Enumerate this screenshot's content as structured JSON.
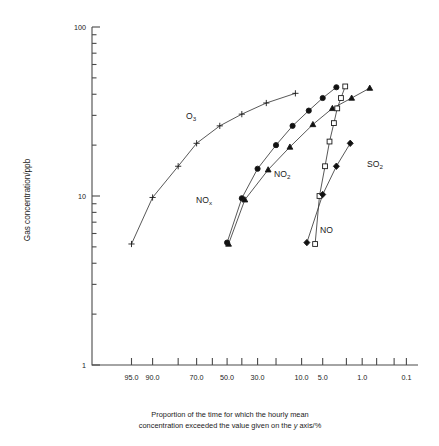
{
  "figure": {
    "ylabel": "Gas concentration/ppb",
    "caption_line1": "Proportion of the time for which the hourly mean",
    "caption_line2a": "concentration exceeded the value given on the ",
    "caption_line2b": "y",
    "caption_line2c": " axis/%"
  },
  "chart_data": {
    "type": "line",
    "title": "",
    "xlabel": "Proportion of the time for which the hourly mean concentration exceeded the value given on the y axis/%",
    "ylabel": "Gas concentration/ppb",
    "x_scale": "probability",
    "y_scale": "log",
    "ylim": [
      1,
      100
    ],
    "xlim": [
      99.0,
      0.05
    ],
    "grid": false,
    "legend": "inline-annotations",
    "y_tick_labels": [
      "100",
      "10",
      "1"
    ],
    "y_major_ticks": [
      100,
      10,
      1
    ],
    "y_minor_ticks": [
      90,
      80,
      70,
      60,
      50,
      40,
      30,
      20,
      9,
      8,
      7,
      6,
      5,
      4,
      3,
      2
    ],
    "x_tick_values": [
      95.0,
      90.0,
      80.0,
      70.0,
      60.0,
      50.0,
      40.0,
      30.0,
      20.0,
      10.0,
      5.0,
      2.0,
      1.0,
      0.5,
      0.2,
      0.1
    ],
    "x_tick_labels": [
      "95.0",
      "90.0",
      "",
      "70.0",
      "",
      "50.0",
      "",
      "30.0",
      "",
      "10.0",
      "5.0",
      "",
      "1.0",
      "",
      "",
      "0.1"
    ],
    "series": [
      {
        "name": "O3",
        "label": "O",
        "label_sub": "3",
        "marker": "plus",
        "filled": false,
        "points": [
          {
            "x": 95.0,
            "y": 5.2
          },
          {
            "x": 90.0,
            "y": 9.8
          },
          {
            "x": 80.0,
            "y": 15.0
          },
          {
            "x": 70.0,
            "y": 20.5
          },
          {
            "x": 55.0,
            "y": 26.0
          },
          {
            "x": 40.0,
            "y": 30.5
          },
          {
            "x": 25.0,
            "y": 35.5
          },
          {
            "x": 12.0,
            "y": 40.5
          }
        ]
      },
      {
        "name": "NOx",
        "label": "NO",
        "label_sub": "x",
        "marker": "circle",
        "filled": true,
        "points": [
          {
            "x": 50.0,
            "y": 5.3
          },
          {
            "x": 40.0,
            "y": 9.7
          },
          {
            "x": 30.0,
            "y": 14.5
          },
          {
            "x": 20.0,
            "y": 20.0
          },
          {
            "x": 13.0,
            "y": 26.0
          },
          {
            "x": 8.0,
            "y": 32.0
          },
          {
            "x": 5.0,
            "y": 38.0
          },
          {
            "x": 3.0,
            "y": 44.0
          }
        ]
      },
      {
        "name": "NO2",
        "label": "NO",
        "label_sub": "2",
        "marker": "triangle",
        "filled": true,
        "points": [
          {
            "x": 49.0,
            "y": 5.2
          },
          {
            "x": 38.0,
            "y": 9.5
          },
          {
            "x": 24.0,
            "y": 14.3
          },
          {
            "x": 14.0,
            "y": 19.5
          },
          {
            "x": 7.0,
            "y": 26.5
          },
          {
            "x": 3.5,
            "y": 33.0
          },
          {
            "x": 1.6,
            "y": 38.0
          },
          {
            "x": 0.7,
            "y": 43.5
          }
        ]
      },
      {
        "name": "NO",
        "label": "NO",
        "label_sub": "",
        "marker": "square",
        "filled": false,
        "points": [
          {
            "x": 6.5,
            "y": 5.2
          },
          {
            "x": 5.6,
            "y": 10.0
          },
          {
            "x": 4.6,
            "y": 15.0
          },
          {
            "x": 3.9,
            "y": 21.0
          },
          {
            "x": 3.3,
            "y": 27.0
          },
          {
            "x": 2.9,
            "y": 33.0
          },
          {
            "x": 2.5,
            "y": 38.0
          },
          {
            "x": 2.1,
            "y": 44.5
          }
        ]
      },
      {
        "name": "SO2",
        "label": "SO",
        "label_sub": "2",
        "marker": "diamond",
        "filled": true,
        "points": [
          {
            "x": 8.5,
            "y": 5.3
          },
          {
            "x": 5.0,
            "y": 10.2
          },
          {
            "x": 3.0,
            "y": 15.0
          },
          {
            "x": 1.7,
            "y": 20.5
          }
        ]
      }
    ],
    "annotations": [
      {
        "text": "O3",
        "px": 186,
        "py": 119
      },
      {
        "text": "NOx",
        "px": 196,
        "py": 203
      },
      {
        "text": "NO2",
        "px": 274,
        "py": 177
      },
      {
        "text": "NO",
        "px": 320,
        "py": 233
      },
      {
        "text": "SO2",
        "px": 367,
        "py": 167
      }
    ]
  }
}
